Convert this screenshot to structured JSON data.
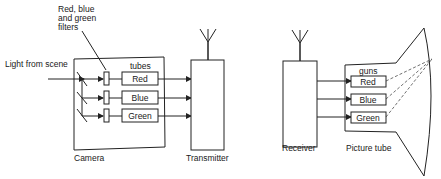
{
  "diagram": {
    "camera": {
      "label": "Camera",
      "input_label": "Light from scene",
      "filters_label_line1": "Red, blue",
      "filters_label_line2": "and green",
      "filters_label_line3": "filters",
      "tubes_label": "tubes",
      "tubes": [
        "Red",
        "Blue",
        "Green"
      ]
    },
    "transmitter": {
      "label": "Transmitter"
    },
    "receiver": {
      "label": "Receiver"
    },
    "picture_tube": {
      "label": "Picture tube",
      "guns_label": "guns",
      "guns": [
        "Red",
        "Blue",
        "Green"
      ]
    },
    "colors": {
      "line": "#222222",
      "background": "#ffffff"
    }
  }
}
